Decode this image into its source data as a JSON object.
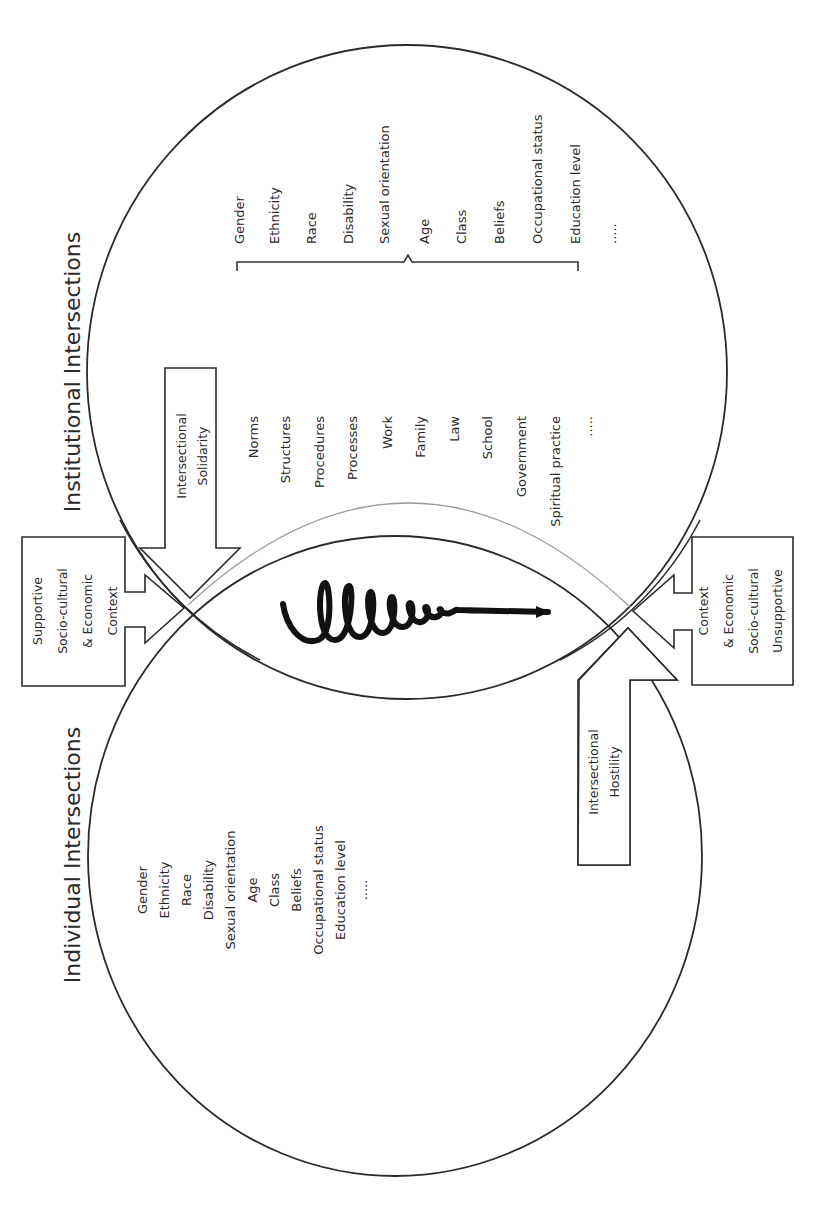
{
  "diagram": {
    "orientation": "rotated-90-ccw",
    "colors": {
      "line": "#2b2b2b",
      "text": "#2a2a2a",
      "lens_edge": "#9a9a9a",
      "background": "#ffffff"
    },
    "institutional": {
      "title": "Institutional Intersections",
      "institutions": [
        "Norms",
        "Structures",
        "Procedures",
        "Processes",
        "Work",
        "Family",
        "Law",
        "School",
        "Government",
        "Spiritual practice",
        "....."
      ],
      "categories": [
        "Gender",
        "Ethnicity",
        "Race",
        "Disability",
        "Sexual orientation",
        "Age",
        "Class",
        "Beliefs",
        "Occupational status",
        "Education level",
        "....."
      ]
    },
    "individual": {
      "title": "Individual Intersections",
      "categories": [
        "Gender",
        "Ethnicity",
        "Race",
        "Disability",
        "Sexual orientation",
        "Age",
        "Class",
        "Beliefs",
        "Occupational status",
        "Education level",
        "....."
      ]
    },
    "solidarity_arrow": {
      "lines": [
        "Intersectional",
        "Solidarity"
      ]
    },
    "hostility_arrow": {
      "lines": [
        "Intersectional",
        "Hostility"
      ]
    },
    "supportive_context": {
      "lines": [
        "Supportive",
        "Socio-cultural",
        "& Economic",
        "Context"
      ]
    },
    "unsupportive_context": {
      "lines": [
        "Unsupportive",
        "Socio-cultural",
        "& Economic",
        "Context"
      ]
    },
    "center_icon": "spiral-arrow-icon"
  }
}
